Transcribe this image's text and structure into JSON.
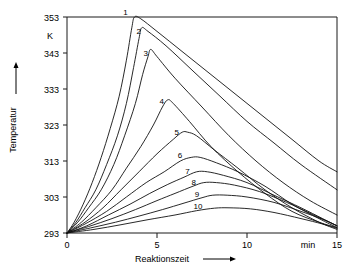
{
  "chart_data": {
    "type": "line",
    "title": "",
    "xlabel": "Reaktionszeit",
    "ylabel": "Temperatur",
    "xunit": "min",
    "yunit": "K",
    "xlim": [
      0,
      15
    ],
    "ylim": [
      293,
      353
    ],
    "xticks": [
      0,
      5,
      10,
      15
    ],
    "yticks": [
      293,
      303,
      313,
      323,
      333,
      343,
      353
    ],
    "xtick_labels": [
      "0",
      "5",
      "10",
      "15"
    ],
    "ytick_labels": [
      "293",
      "303",
      "313",
      "323",
      "333",
      "343",
      "353"
    ],
    "grid": false,
    "legend": "inline-curve-numbers",
    "series": [
      {
        "name": "1",
        "label": "1",
        "peak_x": 3.7,
        "peak_y": 353,
        "points": [
          [
            0,
            293
          ],
          [
            0.4,
            296
          ],
          [
            0.9,
            301
          ],
          [
            1.4,
            307
          ],
          [
            1.9,
            314
          ],
          [
            2.4,
            322
          ],
          [
            2.9,
            331
          ],
          [
            3.3,
            341
          ],
          [
            3.6,
            350
          ],
          [
            3.75,
            353
          ],
          [
            4.1,
            352.5
          ],
          [
            5.0,
            349
          ],
          [
            6.5,
            343
          ],
          [
            8.0,
            337
          ],
          [
            9.5,
            331
          ],
          [
            11.0,
            325
          ],
          [
            12.5,
            319
          ],
          [
            14.0,
            313
          ],
          [
            15,
            310
          ]
        ]
      },
      {
        "name": "2",
        "label": "2",
        "peak_x": 4.1,
        "peak_y": 350,
        "points": [
          [
            0,
            293
          ],
          [
            0.5,
            296
          ],
          [
            1.0,
            300
          ],
          [
            1.6,
            305
          ],
          [
            2.2,
            312
          ],
          [
            2.8,
            320
          ],
          [
            3.3,
            329
          ],
          [
            3.7,
            339
          ],
          [
            4.0,
            347
          ],
          [
            4.15,
            350
          ],
          [
            4.5,
            349
          ],
          [
            5.5,
            345
          ],
          [
            7.0,
            338
          ],
          [
            8.5,
            331
          ],
          [
            10.0,
            324
          ],
          [
            11.5,
            318
          ],
          [
            13.0,
            312
          ],
          [
            15,
            305
          ]
        ]
      },
      {
        "name": "3",
        "label": "3",
        "peak_x": 4.6,
        "peak_y": 344,
        "points": [
          [
            0,
            293
          ],
          [
            0.6,
            296
          ],
          [
            1.2,
            300
          ],
          [
            1.9,
            305
          ],
          [
            2.6,
            312
          ],
          [
            3.2,
            320
          ],
          [
            3.8,
            329
          ],
          [
            4.2,
            337
          ],
          [
            4.5,
            342
          ],
          [
            4.65,
            344
          ],
          [
            5.0,
            342
          ],
          [
            6.0,
            336
          ],
          [
            7.5,
            328
          ],
          [
            9.0,
            320
          ],
          [
            10.5,
            313
          ],
          [
            12.0,
            307
          ],
          [
            13.5,
            302
          ],
          [
            15,
            298
          ]
        ]
      },
      {
        "name": "4",
        "label": "4",
        "peak_x": 5.6,
        "peak_y": 330,
        "points": [
          [
            0,
            293
          ],
          [
            0.8,
            296
          ],
          [
            1.6,
            300
          ],
          [
            2.5,
            305
          ],
          [
            3.3,
            311
          ],
          [
            4.1,
            317
          ],
          [
            4.8,
            323
          ],
          [
            5.3,
            328
          ],
          [
            5.6,
            330
          ],
          [
            5.9,
            329
          ],
          [
            6.8,
            324
          ],
          [
            8.0,
            317
          ],
          [
            9.5,
            310
          ],
          [
            11.0,
            304
          ],
          [
            12.5,
            299
          ],
          [
            14.0,
            296
          ],
          [
            15,
            294.5
          ]
        ]
      },
      {
        "name": "5",
        "label": "5",
        "peak_x": 6.6,
        "peak_y": 321,
        "points": [
          [
            0,
            293
          ],
          [
            1.0,
            296
          ],
          [
            2.0,
            300
          ],
          [
            3.0,
            305
          ],
          [
            4.0,
            310
          ],
          [
            5.0,
            315
          ],
          [
            5.9,
            319
          ],
          [
            6.4,
            321
          ],
          [
            6.7,
            321
          ],
          [
            7.2,
            320
          ],
          [
            8.2,
            316
          ],
          [
            9.5,
            311
          ],
          [
            11.0,
            305
          ],
          [
            12.5,
            300
          ],
          [
            14.0,
            296
          ],
          [
            15,
            294
          ]
        ]
      },
      {
        "name": "6",
        "label": "6",
        "peak_x": 7.0,
        "peak_y": 314,
        "points": [
          [
            0,
            293
          ],
          [
            1.0,
            295.5
          ],
          [
            2.2,
            299
          ],
          [
            3.3,
            303
          ],
          [
            4.4,
            307
          ],
          [
            5.4,
            310
          ],
          [
            6.3,
            313
          ],
          [
            6.9,
            314
          ],
          [
            7.4,
            314
          ],
          [
            8.3,
            312.5
          ],
          [
            9.5,
            310
          ],
          [
            11.0,
            306
          ],
          [
            12.5,
            301
          ],
          [
            14.0,
            297
          ],
          [
            15,
            294.5
          ]
        ]
      },
      {
        "name": "7",
        "label": "7",
        "peak_x": 7.3,
        "peak_y": 310,
        "points": [
          [
            0,
            293
          ],
          [
            1.1,
            295
          ],
          [
            2.3,
            298
          ],
          [
            3.5,
            301
          ],
          [
            4.6,
            304
          ],
          [
            5.6,
            306.5
          ],
          [
            6.5,
            308.5
          ],
          [
            7.2,
            310
          ],
          [
            7.8,
            310
          ],
          [
            8.7,
            309
          ],
          [
            10.0,
            307
          ],
          [
            11.5,
            303.5
          ],
          [
            13.0,
            300
          ],
          [
            14.2,
            297
          ],
          [
            15,
            295
          ]
        ]
      },
      {
        "name": "8",
        "label": "8",
        "peak_x": 7.6,
        "peak_y": 307,
        "points": [
          [
            0,
            293
          ],
          [
            1.2,
            294.8
          ],
          [
            2.5,
            297
          ],
          [
            3.8,
            299.5
          ],
          [
            5.0,
            302
          ],
          [
            6.0,
            304
          ],
          [
            7.0,
            306
          ],
          [
            7.6,
            307
          ],
          [
            8.3,
            307
          ],
          [
            9.3,
            306.3
          ],
          [
            10.7,
            304.5
          ],
          [
            12.2,
            301.5
          ],
          [
            13.5,
            298.5
          ],
          [
            15,
            295
          ]
        ]
      },
      {
        "name": "9",
        "label": "9",
        "peak_x": 8.0,
        "peak_y": 303.5,
        "points": [
          [
            0,
            293
          ],
          [
            1.3,
            294.4
          ],
          [
            2.7,
            296
          ],
          [
            4.0,
            297.7
          ],
          [
            5.3,
            299.5
          ],
          [
            6.5,
            301.3
          ],
          [
            7.5,
            302.8
          ],
          [
            8.1,
            303.5
          ],
          [
            8.9,
            303.5
          ],
          [
            10.0,
            303
          ],
          [
            11.5,
            301.5
          ],
          [
            13.0,
            299
          ],
          [
            14.2,
            296.8
          ],
          [
            15,
            295
          ]
        ]
      },
      {
        "name": "10",
        "label": "10",
        "peak_x": 8.5,
        "peak_y": 300,
        "points": [
          [
            0,
            293
          ],
          [
            1.5,
            294
          ],
          [
            3.0,
            295.3
          ],
          [
            4.5,
            296.7
          ],
          [
            6.0,
            298
          ],
          [
            7.2,
            299.2
          ],
          [
            8.2,
            299.9
          ],
          [
            9.0,
            300
          ],
          [
            10.2,
            299.7
          ],
          [
            11.5,
            298.7
          ],
          [
            13.0,
            297
          ],
          [
            14.2,
            295.5
          ],
          [
            15,
            294.3
          ]
        ]
      }
    ]
  },
  "axes": {
    "x_arrow": "arrow-right",
    "y_arrow": "arrow-up"
  }
}
